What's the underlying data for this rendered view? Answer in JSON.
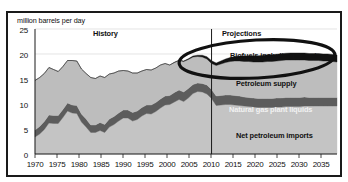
{
  "chart_data": {
    "type": "area",
    "title": "",
    "ylabel": "million barrels per day",
    "xlabel": "",
    "ylim": [
      0,
      25
    ],
    "xlim": [
      1970,
      2035
    ],
    "grid": true,
    "legend_position": "inline-annotations",
    "y_ticks": [
      "0",
      "5",
      "10",
      "15",
      "20",
      "25"
    ],
    "x_ticks": [
      "1970",
      "1975",
      "1980",
      "1985",
      "1990",
      "1995",
      "2000",
      "2005",
      "2010",
      "2015",
      "2020",
      "2025",
      "2030",
      "2035"
    ],
    "history_projection_divider": 2008,
    "region_labels": {
      "history": "History",
      "projections": "Projections"
    },
    "series_labels": {
      "biofuels": "Biofuels including imports",
      "petroleum_supply": "Petroleum supply",
      "ngpl": "Natural gas plant liquids",
      "net_imports": "Net petroleum imports"
    },
    "x": [
      1970,
      1971,
      1972,
      1973,
      1974,
      1975,
      1976,
      1977,
      1978,
      1979,
      1980,
      1981,
      1982,
      1983,
      1984,
      1985,
      1986,
      1987,
      1988,
      1989,
      1990,
      1991,
      1992,
      1993,
      1994,
      1995,
      1996,
      1997,
      1998,
      1999,
      2000,
      2001,
      2002,
      2003,
      2004,
      2005,
      2006,
      2007,
      2008,
      2009,
      2010,
      2011,
      2012,
      2013,
      2014,
      2015,
      2016,
      2017,
      2018,
      2019,
      2020,
      2021,
      2022,
      2023,
      2024,
      2025,
      2026,
      2027,
      2028,
      2029,
      2030,
      2031,
      2032,
      2033,
      2034,
      2035
    ],
    "series": [
      {
        "name": "Net petroleum imports",
        "color": "#c4c4c4",
        "values": [
          3.4,
          4.0,
          4.9,
          6.2,
          6.1,
          6.1,
          7.3,
          8.6,
          8.2,
          8.1,
          6.4,
          5.4,
          4.3,
          4.3,
          4.7,
          4.3,
          5.4,
          5.9,
          6.6,
          7.2,
          7.2,
          6.6,
          6.9,
          7.6,
          8.1,
          8.0,
          8.5,
          9.2,
          9.8,
          9.9,
          10.4,
          10.9,
          10.5,
          11.2,
          12.1,
          12.5,
          12.4,
          12.0,
          11.1,
          9.7,
          9.8,
          9.9,
          9.9,
          9.8,
          9.7,
          9.6,
          9.5,
          9.4,
          9.3,
          9.3,
          9.3,
          9.3,
          9.4,
          9.4,
          9.5,
          9.5,
          9.5,
          9.5,
          9.6,
          9.6,
          9.6,
          9.6,
          9.6,
          9.6,
          9.6,
          9.6
        ]
      },
      {
        "name": "Natural gas plant liquids",
        "color": "#5c5c5c",
        "values": [
          1.4,
          1.5,
          1.6,
          1.6,
          1.6,
          1.6,
          1.6,
          1.6,
          1.6,
          1.6,
          1.6,
          1.6,
          1.5,
          1.5,
          1.6,
          1.6,
          1.6,
          1.6,
          1.6,
          1.6,
          1.6,
          1.7,
          1.7,
          1.7,
          1.7,
          1.8,
          1.8,
          1.8,
          1.8,
          1.8,
          1.9,
          1.9,
          1.9,
          1.9,
          1.8,
          1.7,
          1.7,
          1.8,
          1.8,
          1.9,
          1.9,
          1.9,
          1.9,
          1.9,
          1.9,
          1.8,
          1.8,
          1.8,
          1.8,
          1.8,
          1.8,
          1.8,
          1.8,
          1.8,
          1.8,
          1.8,
          1.8,
          1.8,
          1.8,
          1.7,
          1.7,
          1.7,
          1.7,
          1.7,
          1.7,
          1.7
        ]
      },
      {
        "name": "Petroleum supply",
        "color": "#bdbdbd",
        "values": [
          9.9,
          9.8,
          9.6,
          9.5,
          9.2,
          8.8,
          8.6,
          8.5,
          8.9,
          8.9,
          9.0,
          9.1,
          9.5,
          9.3,
          9.3,
          9.4,
          9.0,
          8.7,
          8.4,
          7.9,
          7.8,
          7.9,
          7.6,
          7.3,
          7.1,
          7.0,
          6.9,
          6.8,
          6.5,
          6.1,
          6.0,
          5.9,
          6.1,
          5.8,
          5.5,
          5.3,
          5.3,
          5.2,
          5.2,
          6.1,
          6.3,
          6.5,
          6.7,
          6.9,
          7.0,
          7.1,
          7.2,
          7.2,
          7.3,
          7.3,
          7.4,
          7.4,
          7.4,
          7.5,
          7.5,
          7.5,
          7.5,
          7.5,
          7.4,
          7.4,
          7.4,
          7.4,
          7.3,
          7.3,
          7.2,
          7.1
        ]
      },
      {
        "name": "Biofuels including imports",
        "color": "#121212",
        "values": [
          0.0,
          0.0,
          0.0,
          0.0,
          0.0,
          0.0,
          0.0,
          0.0,
          0.0,
          0.0,
          0.0,
          0.0,
          0.0,
          0.0,
          0.0,
          0.0,
          0.0,
          0.0,
          0.0,
          0.0,
          0.0,
          0.0,
          0.0,
          0.0,
          0.0,
          0.0,
          0.0,
          0.0,
          0.0,
          0.0,
          0.05,
          0.07,
          0.1,
          0.15,
          0.2,
          0.25,
          0.35,
          0.45,
          0.55,
          0.5,
          0.6,
          0.7,
          0.8,
          0.9,
          1.0,
          1.1,
          1.15,
          1.2,
          1.25,
          1.3,
          1.35,
          1.35,
          1.35,
          1.35,
          1.35,
          1.4,
          1.4,
          1.4,
          1.4,
          1.4,
          1.4,
          1.4,
          1.4,
          1.4,
          1.4,
          1.4
        ]
      }
    ],
    "totals": [
      14.7,
      15.3,
      16.1,
      17.3,
      16.9,
      16.5,
      17.5,
      18.7,
      18.7,
      18.6,
      17.0,
      16.1,
      15.3,
      15.1,
      15.6,
      15.3,
      16.0,
      16.2,
      16.6,
      16.7,
      16.6,
      16.2,
      16.2,
      16.6,
      16.9,
      16.8,
      17.2,
      17.8,
      18.1,
      17.8,
      18.35,
      18.77,
      18.6,
      19.05,
      19.6,
      19.75,
      19.75,
      19.45,
      18.65,
      18.2,
      18.6,
      19.0,
      19.3,
      19.5,
      19.6,
      19.6,
      19.65,
      19.6,
      19.65,
      19.7,
      19.85,
      19.85,
      19.95,
      20.05,
      20.15,
      20.2,
      20.2,
      20.2,
      20.2,
      20.1,
      20.1,
      20.1,
      20.0,
      20.0,
      19.9,
      19.8
    ]
  },
  "annotation": {
    "highlight_shape": "hand-drawn-ellipse",
    "highlight_target": "Biofuels including imports"
  }
}
